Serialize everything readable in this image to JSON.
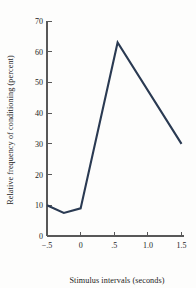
{
  "chart_data": {
    "type": "line",
    "title": "",
    "xlabel": "Stimulus intervals (seconds)",
    "ylabel": "Relative frequency of conditioning (percent)",
    "xlim": [
      -0.5,
      1.5
    ],
    "ylim": [
      0,
      70
    ],
    "grid": false,
    "legend": "none",
    "xticks": [
      -0.5,
      0,
      0.5,
      1.0,
      1.5
    ],
    "xtick_labels": [
      "−.5",
      "0",
      ".5",
      "1.0",
      "1.5"
    ],
    "yticks": [
      0,
      10,
      20,
      30,
      40,
      50,
      60,
      70
    ],
    "ytick_labels": [
      "0",
      "10",
      "20",
      "30",
      "40",
      "50",
      "60",
      "70"
    ],
    "series": [
      {
        "name": "Relative frequency of conditioning",
        "color": "#2a3a52",
        "x": [
          -0.5,
          -0.25,
          0.0,
          0.55,
          1.5
        ],
        "values": [
          10,
          7.5,
          9,
          63,
          30
        ]
      }
    ]
  },
  "axes": {
    "x_title": "Stimulus intervals (seconds)",
    "y_title": "Relative frequency of conditioning (percent)"
  },
  "colors": {
    "line": "#2a3a52",
    "axis": "#585858",
    "background": "#fdfdfc",
    "text": "#1b1b1b"
  }
}
